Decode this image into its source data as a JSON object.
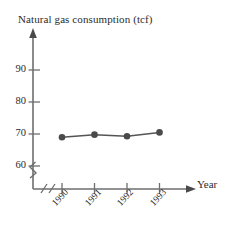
{
  "chart_data": {
    "type": "line",
    "title": "Natural gas consumption (tcf)",
    "xlabel": "Year",
    "ylabel": "Natural gas consumption (tcf)",
    "categories": [
      "1990",
      "1991",
      "1992",
      "1993"
    ],
    "values": [
      69.0,
      69.8,
      69.3,
      70.5
    ],
    "series": [
      {
        "name": "Natural gas consumption",
        "values": [
          69.0,
          69.8,
          69.3,
          70.5
        ]
      }
    ],
    "ylim": [
      55,
      95
    ],
    "ytick_labels": [
      "60",
      "70",
      "80",
      "90"
    ],
    "ytick_values": [
      60,
      70,
      80,
      90
    ],
    "xtick_labels": [
      "1990",
      "1991",
      "1992",
      "1993"
    ],
    "grid": false,
    "legend": false,
    "y_axis_break": true,
    "x_axis_break": true,
    "marker": "filled-circle",
    "line_color": "#555555",
    "marker_color": "#4a4a4a",
    "axis_color": "#6e6e6e",
    "text_color": "#2b2b2b",
    "background": "#ffffff"
  },
  "axes": {
    "y_ticks": [
      {
        "label": "90"
      },
      {
        "label": "80"
      },
      {
        "label": "70"
      },
      {
        "label": "60"
      }
    ],
    "x_ticks": [
      {
        "label": "1990"
      },
      {
        "label": "1991"
      },
      {
        "label": "1992"
      },
      {
        "label": "1993"
      }
    ],
    "x_axis_name": "Year"
  }
}
